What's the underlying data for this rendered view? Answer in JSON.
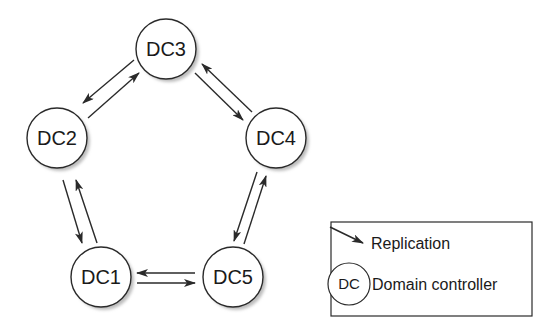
{
  "diagram": {
    "nodes": [
      {
        "id": "DC3",
        "label": "DC3"
      },
      {
        "id": "DC2",
        "label": "DC2"
      },
      {
        "id": "DC4",
        "label": "DC4"
      },
      {
        "id": "DC1",
        "label": "DC1"
      },
      {
        "id": "DC5",
        "label": "DC5"
      }
    ],
    "edges": [
      {
        "from": "DC3",
        "to": "DC2"
      },
      {
        "from": "DC2",
        "to": "DC3"
      },
      {
        "from": "DC3",
        "to": "DC4"
      },
      {
        "from": "DC4",
        "to": "DC3"
      },
      {
        "from": "DC2",
        "to": "DC1"
      },
      {
        "from": "DC1",
        "to": "DC2"
      },
      {
        "from": "DC4",
        "to": "DC5"
      },
      {
        "from": "DC5",
        "to": "DC4"
      },
      {
        "from": "DC5",
        "to": "DC1"
      },
      {
        "from": "DC1",
        "to": "DC5"
      }
    ],
    "topology": "ring"
  },
  "legend": {
    "replication_label": "Replication",
    "dc_symbol_label": "DC",
    "dc_label": "Domain controller"
  },
  "colors": {
    "stroke": "#2a2a2a",
    "shadow": "#bdbdbd",
    "fill": "#ffffff"
  }
}
